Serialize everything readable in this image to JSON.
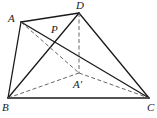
{
  "diagram": {
    "type": "geometry-figure",
    "points": {
      "A": {
        "label": "A",
        "x": 21,
        "y": 22,
        "lx": 8,
        "ly": 22
      },
      "D": {
        "label": "D",
        "x": 79,
        "y": 13,
        "lx": 76,
        "ly": 9
      },
      "P": {
        "label": "P",
        "x": 55,
        "y": 38,
        "lx": 51,
        "ly": 33
      },
      "A_prime": {
        "label": "A′",
        "x": 79,
        "y": 73,
        "lx": 73,
        "ly": 88
      },
      "B": {
        "label": "B",
        "x": 8,
        "y": 98,
        "lx": 2,
        "ly": 111
      },
      "C": {
        "label": "C",
        "x": 149,
        "y": 98,
        "lx": 147,
        "ly": 111
      }
    },
    "solid_segments": [
      [
        "A",
        "D"
      ],
      [
        "A",
        "B"
      ],
      [
        "B",
        "C"
      ],
      [
        "D",
        "C"
      ],
      [
        "A",
        "C"
      ],
      [
        "B",
        "D"
      ]
    ],
    "dashed_segments": [
      [
        "D",
        "A_prime"
      ],
      [
        "A",
        "A_prime"
      ],
      [
        "B",
        "A_prime"
      ],
      [
        "A_prime",
        "C"
      ]
    ],
    "colors": {
      "stroke": "#1a1a1a",
      "dashed": "#555555",
      "background": "#ffffff"
    }
  }
}
